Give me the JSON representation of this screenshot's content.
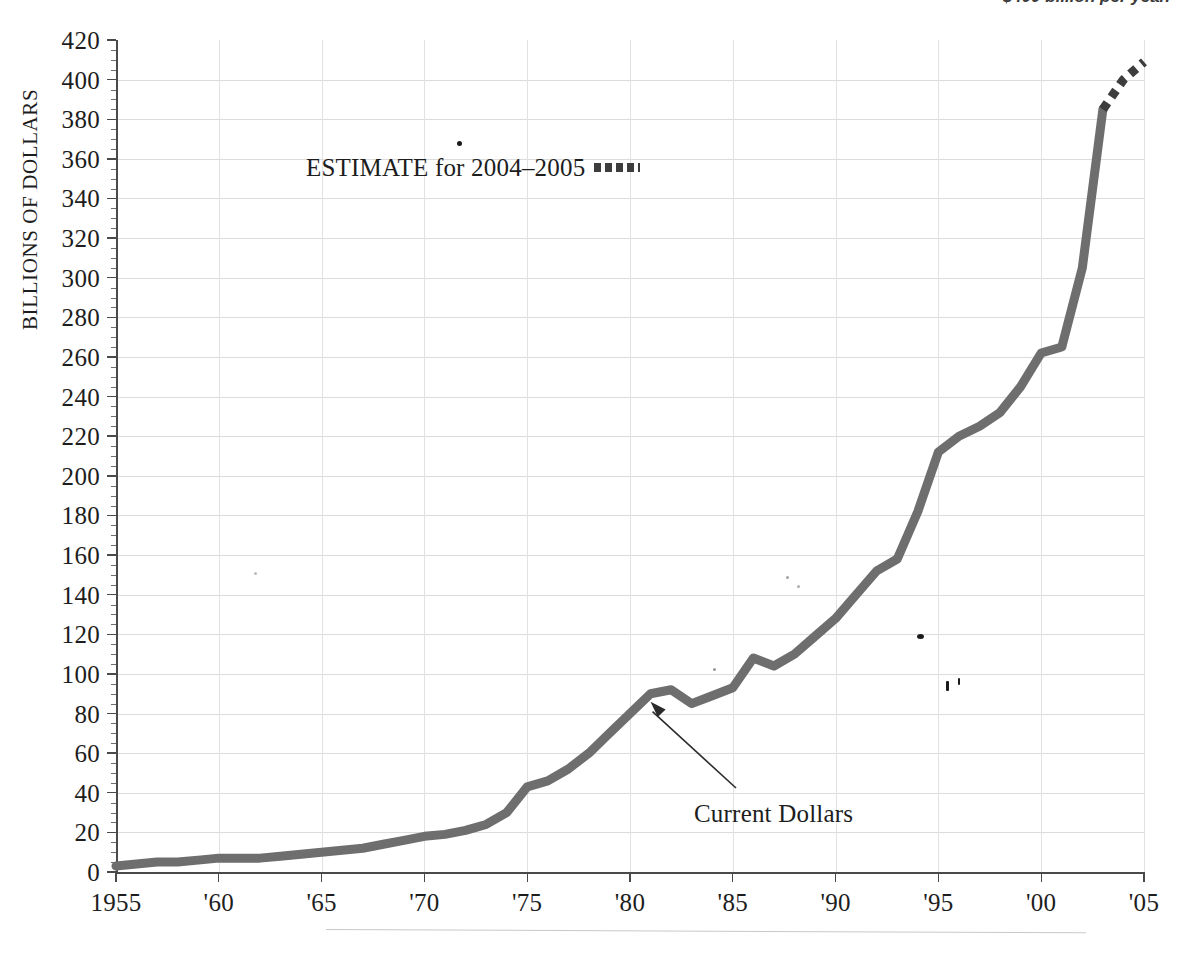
{
  "page": {
    "top_caption_fragment": "$400 billion per year."
  },
  "chart_data": {
    "type": "line",
    "title": "",
    "subtitle": "",
    "xlabel": "",
    "ylabel": "BILLIONS OF DOLLARS",
    "xlim": [
      1955,
      2005
    ],
    "ylim": [
      0,
      420
    ],
    "y_tick_step": 20,
    "y_minor_step": 5,
    "grid": "both",
    "legend_position": "inside-top-left",
    "x_tick_labels": [
      "1955",
      "'60",
      "'65",
      "'70",
      "'75",
      "'80",
      "'85",
      "'90",
      "'95",
      "'00",
      "'05"
    ],
    "x_tick_values": [
      1955,
      1960,
      1965,
      1970,
      1975,
      1980,
      1985,
      1990,
      1995,
      2000,
      2005
    ],
    "y_tick_labels": [
      "0",
      "20",
      "40",
      "60",
      "80",
      "100",
      "120",
      "140",
      "160",
      "180",
      "200",
      "220",
      "240",
      "260",
      "280",
      "300",
      "320",
      "340",
      "360",
      "380",
      "400",
      "420"
    ],
    "y_tick_values": [
      0,
      20,
      40,
      60,
      80,
      100,
      120,
      140,
      160,
      180,
      200,
      220,
      240,
      260,
      280,
      300,
      320,
      340,
      360,
      380,
      400,
      420
    ],
    "series": [
      {
        "name": "Current Dollars",
        "style": "solid",
        "color": "#6e6e6e",
        "x": [
          1955,
          1956,
          1957,
          1958,
          1959,
          1960,
          1961,
          1962,
          1963,
          1964,
          1965,
          1966,
          1967,
          1968,
          1969,
          1970,
          1971,
          1972,
          1973,
          1974,
          1975,
          1976,
          1977,
          1978,
          1979,
          1980,
          1981,
          1982,
          1983,
          1984,
          1985,
          1986,
          1987,
          1988,
          1989,
          1990,
          1991,
          1992,
          1993,
          1994,
          1995,
          1996,
          1997,
          1998,
          1999,
          2000,
          2001,
          2002,
          2003
        ],
        "y": [
          3,
          4,
          5,
          5,
          6,
          7,
          7,
          7,
          8,
          9,
          10,
          11,
          12,
          14,
          16,
          18,
          19,
          21,
          24,
          30,
          43,
          46,
          52,
          60,
          70,
          80,
          90,
          92,
          85,
          89,
          93,
          108,
          104,
          110,
          119,
          128,
          140,
          152,
          158,
          182,
          212,
          220,
          225,
          232,
          245,
          262,
          265,
          305,
          385
        ]
      },
      {
        "name": "ESTIMATE for 2004–2005",
        "style": "dashed",
        "color": "#3d3d3d",
        "x": [
          2003,
          2004,
          2005
        ],
        "y": [
          385,
          400,
          409
        ]
      }
    ],
    "annotations": [
      {
        "name": "current-dollars-callout",
        "text": "Current Dollars",
        "points_to_x": 1981,
        "points_to_y": 90
      }
    ],
    "legend_entries": [
      {
        "label": "ESTIMATE for 2004–2005",
        "style": "dashed",
        "color": "#3d3d3d"
      }
    ]
  }
}
